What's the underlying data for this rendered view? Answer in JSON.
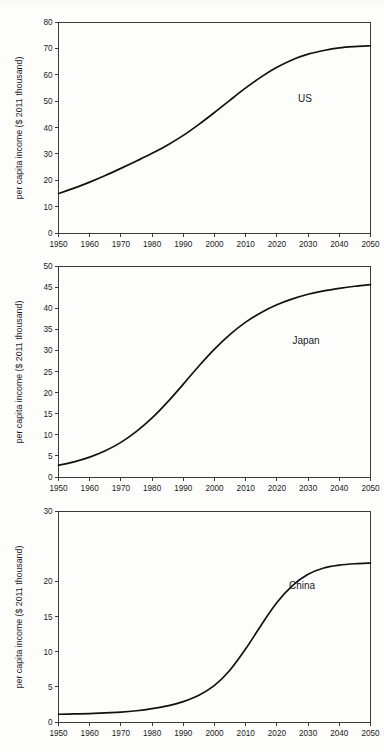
{
  "figure": {
    "background_color": "#fdfdfc",
    "curve_color": "#111111",
    "axis_color": "#3a3a3a"
  },
  "chart_data": [
    {
      "type": "line",
      "title": "",
      "series_label": "US",
      "xlabel": "",
      "ylabel": "per capita income ($ 2011 thousand)",
      "xlim": [
        1950,
        2050
      ],
      "ylim": [
        0,
        80
      ],
      "xticks": [
        1950,
        1960,
        1970,
        1980,
        1990,
        2000,
        2010,
        2020,
        2030,
        2040,
        2050
      ],
      "yticks": [
        0,
        10,
        20,
        30,
        40,
        50,
        60,
        70,
        80
      ],
      "grid": false,
      "legend": "inline-label",
      "x": [
        1950,
        1955,
        1960,
        1965,
        1970,
        1975,
        1980,
        1985,
        1990,
        1995,
        2000,
        2005,
        2010,
        2015,
        2020,
        2025,
        2030,
        2035,
        2040,
        2045,
        2050
      ],
      "values": [
        15.0,
        17.0,
        19.3,
        21.8,
        24.5,
        27.3,
        30.2,
        33.4,
        37.0,
        41.2,
        45.7,
        50.4,
        55.0,
        59.2,
        62.8,
        65.7,
        67.8,
        69.2,
        70.2,
        70.7,
        71.0
      ]
    },
    {
      "type": "line",
      "title": "",
      "series_label": "Japan",
      "xlabel": "",
      "ylabel": "per capita income ($ 2011 thousand)",
      "xlim": [
        1950,
        2050
      ],
      "ylim": [
        0,
        50
      ],
      "xticks": [
        1950,
        1960,
        1970,
        1980,
        1990,
        2000,
        2010,
        2020,
        2030,
        2040,
        2050
      ],
      "yticks": [
        0,
        5,
        10,
        15,
        20,
        25,
        30,
        35,
        40,
        45,
        50
      ],
      "grid": false,
      "legend": "inline-label",
      "x": [
        1950,
        1955,
        1960,
        1965,
        1970,
        1975,
        1980,
        1985,
        1990,
        1995,
        2000,
        2005,
        2010,
        2015,
        2020,
        2025,
        2030,
        2035,
        2040,
        2045,
        2050
      ],
      "values": [
        2.8,
        3.6,
        4.7,
        6.2,
        8.2,
        10.8,
        14.0,
        17.8,
        22.0,
        26.3,
        30.3,
        33.8,
        36.7,
        39.0,
        40.8,
        42.2,
        43.3,
        44.1,
        44.7,
        45.2,
        45.6
      ]
    },
    {
      "type": "line",
      "title": "",
      "series_label": "China",
      "xlabel": "",
      "ylabel": "per capita income ($ 2011 thousand)",
      "xlim": [
        1950,
        2050
      ],
      "ylim": [
        0,
        30
      ],
      "xticks": [
        1950,
        1960,
        1970,
        1980,
        1990,
        2000,
        2010,
        2020,
        2030,
        2040,
        2050
      ],
      "yticks": [
        0,
        5,
        10,
        15,
        20,
        30
      ],
      "grid": false,
      "legend": "inline-label",
      "x": [
        1950,
        1955,
        1960,
        1965,
        1970,
        1975,
        1980,
        1985,
        1990,
        1995,
        2000,
        2005,
        2010,
        2015,
        2020,
        2025,
        2030,
        2035,
        2040,
        2045,
        2050
      ],
      "values": [
        1.1,
        1.15,
        1.2,
        1.3,
        1.4,
        1.6,
        1.9,
        2.3,
        2.9,
        3.8,
        5.2,
        7.4,
        10.4,
        13.8,
        17.0,
        19.4,
        21.0,
        21.9,
        22.3,
        22.5,
        22.6
      ]
    }
  ]
}
